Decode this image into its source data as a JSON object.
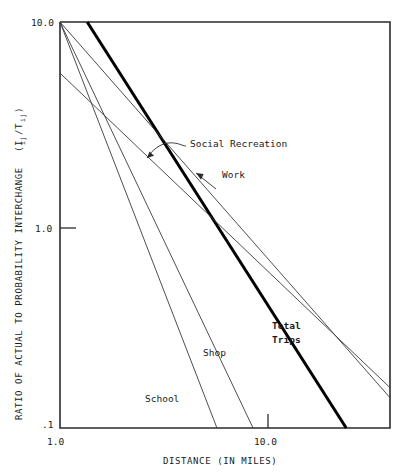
{
  "figure": {
    "background": "#ffffff",
    "ink": "#1a1a1a"
  },
  "axes": {
    "x": {
      "label": "DISTANCE (IN MILES)",
      "ticks": [
        "1.0",
        "10.0"
      ],
      "tick_values": [
        1.0,
        10.0
      ],
      "scale": "log",
      "range": [
        1.0,
        22.0
      ]
    },
    "y": {
      "label": "RATIO OF ACTUAL TO PROBABILITY INTERCHANGE",
      "label_symbol": "(I",
      "label_sub1": "ij",
      "label_mid": "/T",
      "label_sub2": "ij",
      "label_close": ")",
      "ticks": [
        "10.0",
        "1.0",
        ".1"
      ],
      "tick_values": [
        10.0,
        1.0,
        0.1
      ],
      "scale": "log",
      "range": [
        0.1,
        10.0
      ]
    }
  },
  "annotations": [
    {
      "name": "social-recreation",
      "text": "Social Recreation"
    },
    {
      "name": "work",
      "text": "Work"
    },
    {
      "name": "total-trips-line1",
      "text": "Total"
    },
    {
      "name": "total-trips-line2",
      "text": "Trips"
    },
    {
      "name": "shop",
      "text": "Shop"
    },
    {
      "name": "school",
      "text": "School"
    }
  ],
  "chart_data": {
    "type": "line",
    "title": "",
    "xlabel": "DISTANCE (IN MILES)",
    "ylabel": "RATIO OF ACTUAL TO PROBABILITY INTERCHANGE (Iij/Tij)",
    "xscale": "log",
    "yscale": "log",
    "xlim": [
      1.0,
      22.0
    ],
    "ylim": [
      0.1,
      10.0
    ],
    "xticks": [
      1.0,
      10.0
    ],
    "yticks": [
      0.1,
      1.0,
      10.0
    ],
    "grid": false,
    "legend": "inline-annotations",
    "series": [
      {
        "name": "School",
        "style": "thin",
        "points": [
          {
            "x": 1.0,
            "y": 10.0
          },
          {
            "x": 4.35,
            "y": 0.1
          }
        ]
      },
      {
        "name": "Shop",
        "style": "thin",
        "points": [
          {
            "x": 1.0,
            "y": 10.0
          },
          {
            "x": 6.1,
            "y": 0.1
          }
        ]
      },
      {
        "name": "Total Trips",
        "style": "thick",
        "points": [
          {
            "x": 1.29,
            "y": 10.0
          },
          {
            "x": 14.6,
            "y": 0.1
          }
        ]
      },
      {
        "name": "Work",
        "style": "thin",
        "points": [
          {
            "x": 1.0,
            "y": 10.0
          },
          {
            "x": 22.0,
            "y": 0.141
          }
        ]
      },
      {
        "name": "Social Recreation",
        "style": "thin",
        "points": [
          {
            "x": 1.0,
            "y": 5.6
          },
          {
            "x": 22.0,
            "y": 0.158
          }
        ]
      }
    ]
  }
}
